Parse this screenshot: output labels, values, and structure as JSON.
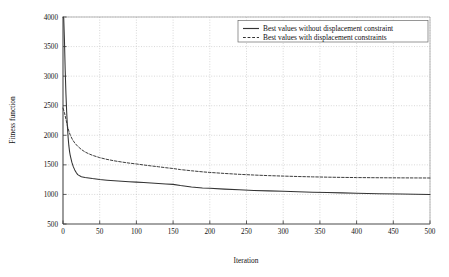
{
  "chart_data": {
    "type": "line",
    "title": "",
    "xlabel": "Iteration",
    "ylabel": "Fitness function",
    "xlim": [
      0,
      500
    ],
    "ylim": [
      500,
      4000
    ],
    "grid": true,
    "legend_position": "top-right",
    "xticks": [
      0,
      50,
      100,
      150,
      200,
      250,
      300,
      350,
      400,
      450,
      500
    ],
    "xtick_labels": [
      "0",
      "50",
      "100",
      "150",
      "200",
      "250",
      "300",
      "350",
      "400",
      "450",
      "500"
    ],
    "yticks": [
      500,
      1000,
      1500,
      2000,
      2500,
      3000,
      3500,
      4000
    ],
    "ytick_labels": [
      "500",
      "1000",
      "1500",
      "2000",
      "2500",
      "3000",
      "3500",
      "4000"
    ],
    "series": [
      {
        "name": "Best values without displacement constraint",
        "style": "solid",
        "color": "#333333",
        "x": [
          0,
          1,
          2,
          3,
          4,
          5,
          6,
          7,
          8,
          9,
          10,
          12,
          14,
          16,
          18,
          20,
          25,
          30,
          35,
          40,
          50,
          60,
          70,
          80,
          90,
          100,
          110,
          120,
          130,
          140,
          150,
          160,
          175,
          190,
          200,
          220,
          240,
          260,
          280,
          300,
          320,
          340,
          360,
          380,
          400,
          430,
          460,
          500
        ],
        "y": [
          4000,
          3980,
          3600,
          3100,
          2700,
          2400,
          2150,
          1960,
          1820,
          1720,
          1650,
          1545,
          1470,
          1415,
          1370,
          1335,
          1300,
          1288,
          1278,
          1268,
          1252,
          1240,
          1230,
          1222,
          1215,
          1208,
          1200,
          1193,
          1186,
          1178,
          1170,
          1150,
          1125,
          1110,
          1105,
          1090,
          1078,
          1068,
          1060,
          1052,
          1045,
          1038,
          1032,
          1026,
          1020,
          1012,
          1006,
          1000
        ]
      },
      {
        "name": "Best values with displacement constraints",
        "style": "dashed",
        "color": "#333333",
        "x": [
          0,
          2,
          4,
          6,
          8,
          10,
          13,
          16,
          20,
          25,
          30,
          35,
          40,
          50,
          60,
          70,
          80,
          90,
          100,
          110,
          120,
          130,
          140,
          150,
          160,
          175,
          190,
          200,
          220,
          240,
          260,
          280,
          300,
          320,
          340,
          360,
          380,
          400,
          430,
          460,
          500
        ],
        "y": [
          2460,
          2380,
          2270,
          2160,
          2070,
          2000,
          1925,
          1870,
          1815,
          1760,
          1718,
          1688,
          1662,
          1622,
          1592,
          1568,
          1548,
          1530,
          1515,
          1498,
          1482,
          1468,
          1452,
          1438,
          1420,
          1400,
          1382,
          1372,
          1355,
          1340,
          1328,
          1318,
          1310,
          1303,
          1297,
          1292,
          1288,
          1285,
          1282,
          1280,
          1278
        ]
      }
    ],
    "legend_entries": [
      "Best values without displacement constraint",
      "Best values with displacement constraints"
    ]
  }
}
